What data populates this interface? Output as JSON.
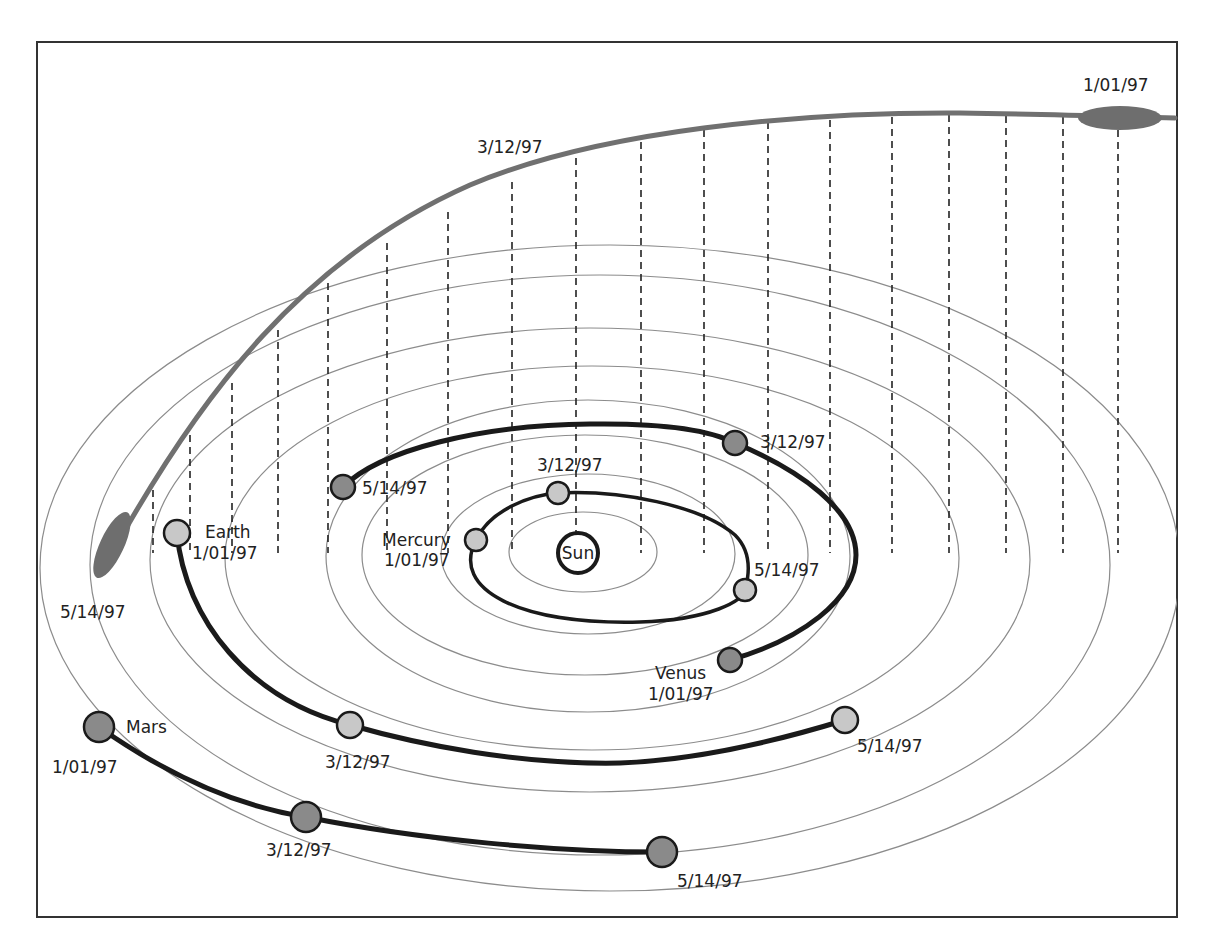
{
  "header": {
    "cut_text": ""
  },
  "diagram": {
    "sun_label": "Sun",
    "planets": {
      "mercury": {
        "name": "Mercury",
        "d1": "1/01/97",
        "d2": "3/12/97",
        "d3": "5/14/97"
      },
      "venus": {
        "name": "Venus",
        "d1": "1/01/97",
        "d2": "3/12/97",
        "d3": "5/14/97"
      },
      "earth": {
        "name": "Earth",
        "d1": "1/01/97",
        "d2": "3/12/97",
        "d3": "5/14/97"
      },
      "mars": {
        "name": "Mars",
        "d1": "1/01/97",
        "d2": "3/12/97",
        "d3": "5/14/97"
      }
    },
    "comet": {
      "d1": "1/01/97",
      "d2": "3/12/97",
      "d3": "5/14/97"
    },
    "colors": {
      "inner_planet_fill": "#c8c8c8",
      "outer_planet_fill": "#8a8a8a",
      "comet_fill": "#6e6e6e",
      "orbit_stroke": "#8c8c8c"
    }
  }
}
